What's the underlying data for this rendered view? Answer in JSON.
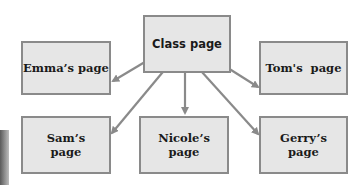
{
  "diagram": {
    "type": "hierarchy",
    "root": {
      "id": "class",
      "label": "Class page"
    },
    "children": [
      {
        "id": "emma",
        "label": "Emma’s page"
      },
      {
        "id": "tom",
        "label": "Tom's  page"
      },
      {
        "id": "sam",
        "label_line1": "Sam’s",
        "label_line2": "page"
      },
      {
        "id": "nicole",
        "label_line1": "Nicole’s",
        "label_line2": "page"
      },
      {
        "id": "gerry",
        "label_line1": "Gerry’s",
        "label_line2": "page"
      }
    ],
    "edges": [
      {
        "from": "class",
        "to": "emma"
      },
      {
        "from": "class",
        "to": "tom"
      },
      {
        "from": "class",
        "to": "sam"
      },
      {
        "from": "class",
        "to": "nicole"
      },
      {
        "from": "class",
        "to": "gerry"
      }
    ],
    "colors": {
      "box_fill": "#e6e6e6",
      "box_border": "#8a8a8a",
      "arrow": "#8a8a8a",
      "text": "#1a1a1a"
    }
  }
}
